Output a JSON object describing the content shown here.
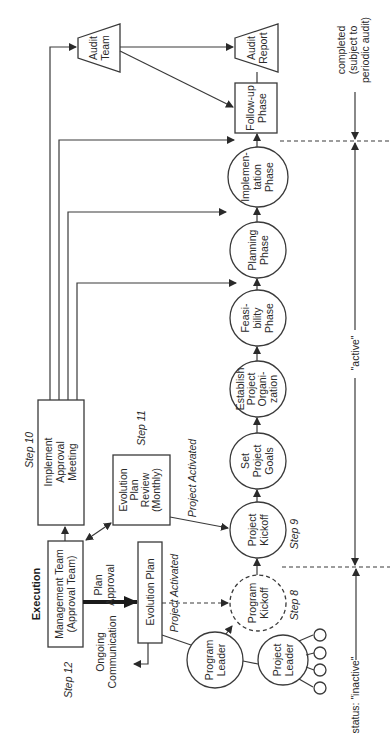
{
  "diagram": {
    "orientation": "rotated-90-ccw",
    "section_title": "Execution",
    "nodes": {
      "management_team": {
        "line1": "Management Team",
        "line2": "(Approval Team)",
        "shape": "box"
      },
      "implement_meeting": {
        "line1": "Implement",
        "line2": "Approval",
        "line3": "Meeting",
        "shape": "box"
      },
      "evolution_review": {
        "line1": "Evolution",
        "line2": "Plan",
        "line3": "Review",
        "line4": "(Monthly)",
        "shape": "box"
      },
      "evolution_plan": {
        "line1": "Evolution Plan",
        "shape": "box"
      },
      "program_leader": {
        "line1": "Program",
        "line2": "Leader",
        "shape": "circle"
      },
      "project_leader": {
        "line1": "Project",
        "line2": "Leader",
        "shape": "circle"
      },
      "program_kickoff": {
        "line1": "Program",
        "line2": "Kickoff",
        "shape": "dashed-circle"
      },
      "project_kickoff": {
        "line1": "Project",
        "line2": "Kickoff",
        "shape": "circle"
      },
      "set_goals": {
        "line1": "Set",
        "line2": "Project",
        "line3": "Goals",
        "shape": "circle"
      },
      "establish_org": {
        "line1": "Establish",
        "line2": "Project",
        "line3": "Organi-",
        "line4": "zation",
        "shape": "circle"
      },
      "feasibility": {
        "line1": "Feasi-",
        "line2": "bility",
        "line3": "Phase",
        "shape": "circle"
      },
      "planning": {
        "line1": "Planning",
        "line2": "Phase",
        "shape": "circle"
      },
      "implementation": {
        "line1": "Implemen-",
        "line2": "tation",
        "line3": "Phase",
        "shape": "circle"
      },
      "followup": {
        "line1": "Follow-up",
        "line2": "Phase",
        "shape": "box"
      },
      "audit_team": {
        "line1": "Audit",
        "line2": "Team",
        "shape": "trapezoid"
      },
      "audit_report": {
        "line1": "Audit",
        "line2": "Report",
        "shape": "trapezoid"
      }
    },
    "labels": {
      "step8": "Step 8",
      "step9": "Step 9",
      "step10": "Step 10",
      "step11": "Step 11",
      "step12": "Step 12",
      "plan_approval_1": "Plan",
      "plan_approval_2": "Approval",
      "ongoing_1": "Ongoing",
      "ongoing_2": "Communication",
      "project_activated_a": "Project Activated",
      "project_activated_b": "Project Activated"
    },
    "status": {
      "inactive": "status: \"inactive\"",
      "active": "\"active\"",
      "completed_1": "completed",
      "completed_2": "(subject to",
      "completed_3": "periodic audit)"
    },
    "colors": {
      "line": "#3a3a3a",
      "background": "#ffffff",
      "text": "#2a2a2a"
    }
  }
}
